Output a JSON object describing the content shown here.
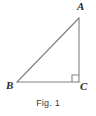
{
  "figure": {
    "caption": "Fig. 1",
    "type": "right-triangle-diagram",
    "line_color": "#808080",
    "label_color": "#2b2b2b",
    "background_color": "#ffffff",
    "vertices": [
      {
        "name": "A",
        "label": "A",
        "x": 79,
        "y": 18
      },
      {
        "name": "B",
        "label": "B",
        "x": 17,
        "y": 82
      },
      {
        "name": "C",
        "label": "C",
        "x": 79,
        "y": 82
      }
    ],
    "sides": [
      {
        "name": "hypotenuse-AB",
        "from": "B",
        "to": "A"
      },
      {
        "name": "leg-BC",
        "from": "B",
        "to": "C"
      },
      {
        "name": "leg-AC",
        "from": "A",
        "to": "C"
      }
    ],
    "right_angle": {
      "at": "C",
      "marker": "square",
      "size": 7
    }
  }
}
